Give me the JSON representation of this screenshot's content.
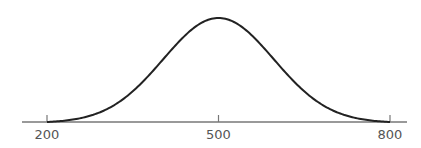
{
  "chart_data": {
    "type": "line",
    "title": "",
    "xlabel": "",
    "ylabel": "",
    "x_ticks": [
      200,
      500,
      800
    ],
    "x_tick_labels": [
      "200",
      "500",
      "800"
    ],
    "xlim": [
      200,
      800
    ],
    "peak_x": 500,
    "series": [
      {
        "name": "distribution",
        "x": [
          200,
          250,
          300,
          350,
          400,
          450,
          500,
          550,
          600,
          650,
          700,
          750,
          800
        ],
        "values": [
          0.0,
          0.06,
          0.19,
          0.41,
          0.67,
          0.9,
          1.0,
          0.9,
          0.67,
          0.41,
          0.19,
          0.06,
          0.0
        ]
      }
    ],
    "grid": false,
    "legend": null,
    "colors": {
      "curve": "#222222",
      "axis": "#777777",
      "tick_label": "#555555"
    }
  }
}
